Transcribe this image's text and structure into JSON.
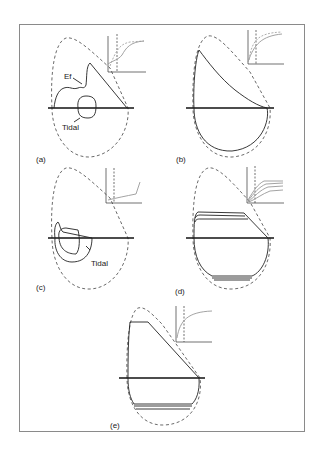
{
  "figure": {
    "panels": [
      {
        "id": "a",
        "label": "(a)",
        "annotations": [
          "Ef",
          "Tidal"
        ]
      },
      {
        "id": "b",
        "label": "(b)",
        "annotations": []
      },
      {
        "id": "c",
        "label": "(c)",
        "annotations": [
          "Tidal"
        ]
      },
      {
        "id": "d",
        "label": "(d)",
        "annotations": []
      },
      {
        "id": "e",
        "label": "(e)",
        "annotations": []
      }
    ]
  }
}
